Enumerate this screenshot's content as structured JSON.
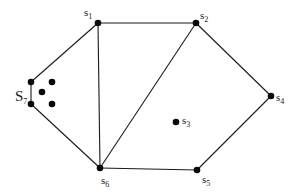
{
  "diagram": {
    "type": "graph",
    "colors": {
      "stroke": "#1a1a1a",
      "node": "#0a0a0a",
      "background": "#ffffff"
    },
    "nodes": [
      {
        "id": "s1",
        "base": "s",
        "sub": "1",
        "x": 98,
        "y": 23,
        "label_x": 84,
        "label_y": 16
      },
      {
        "id": "s2",
        "base": "s",
        "sub": "2",
        "x": 196,
        "y": 23,
        "label_x": 200,
        "label_y": 19
      },
      {
        "id": "s3",
        "base": "s",
        "sub": "3",
        "x": 176,
        "y": 122,
        "label_x": 182,
        "label_y": 124
      },
      {
        "id": "s4",
        "base": "s",
        "sub": "4",
        "x": 271,
        "y": 96,
        "label_x": 276,
        "label_y": 101
      },
      {
        "id": "s5",
        "base": "s",
        "sub": "5",
        "x": 197,
        "y": 170,
        "label_x": 202,
        "label_y": 183
      },
      {
        "id": "s6",
        "base": "s",
        "sub": "6",
        "x": 100,
        "y": 168,
        "label_x": 101,
        "label_y": 184
      },
      {
        "id": "s7",
        "base": "S",
        "sub": "7",
        "x": 31,
        "y": 104,
        "label_x": 15,
        "label_y": 101
      }
    ],
    "extra_nodes": [
      {
        "id": "s7-top",
        "x": 31,
        "y": 82
      },
      {
        "id": "p-a",
        "x": 52,
        "y": 82
      },
      {
        "id": "p-b",
        "x": 42,
        "y": 92
      },
      {
        "id": "p-c",
        "x": 52,
        "y": 104
      }
    ],
    "edges": [
      {
        "from": "s7-top",
        "to": "s1"
      },
      {
        "from": "s1",
        "to": "s2"
      },
      {
        "from": "s2",
        "to": "s4"
      },
      {
        "from": "s4",
        "to": "s5"
      },
      {
        "from": "s5",
        "to": "s6"
      },
      {
        "from": "s6",
        "to": "s7"
      },
      {
        "from": "s7",
        "to": "s7-top"
      },
      {
        "from": "s1",
        "to": "s6"
      },
      {
        "from": "s2",
        "to": "s6"
      }
    ]
  }
}
